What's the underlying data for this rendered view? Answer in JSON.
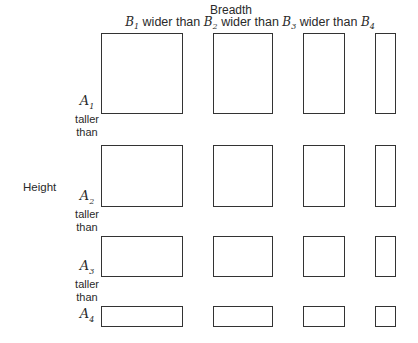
{
  "header": {
    "title": "Breadth",
    "columns": [
      {
        "var": "B",
        "sub": "1"
      },
      {
        "var": "B",
        "sub": "2"
      },
      {
        "var": "B",
        "sub": "3"
      },
      {
        "var": "B",
        "sub": "4"
      }
    ],
    "relation": "wider than"
  },
  "side_label": "Height",
  "rows": [
    {
      "var": "A",
      "sub": "1",
      "relation": "taller than"
    },
    {
      "var": "A",
      "sub": "2",
      "relation": "taller than"
    },
    {
      "var": "A",
      "sub": "3",
      "relation": "taller than"
    },
    {
      "var": "A",
      "sub": "4",
      "relation": ""
    }
  ],
  "taller": "taller",
  "than": "than"
}
